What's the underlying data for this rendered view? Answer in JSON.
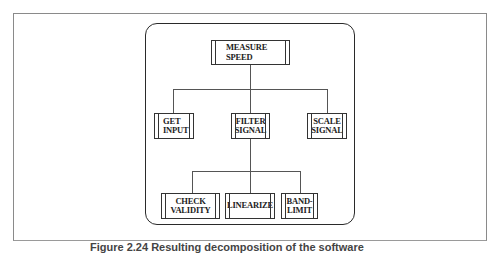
{
  "diagram": {
    "type": "structure-chart",
    "root": {
      "label": "MEASURE\nSPEED"
    },
    "level1": [
      {
        "label": "GET\nINPUT"
      },
      {
        "label": "FILTER\nSIGNAL"
      },
      {
        "label": "SCALE\nSIGNAL"
      }
    ],
    "level2": [
      {
        "label": "CHECK\nVALIDITY",
        "parent": "FILTER SIGNAL"
      },
      {
        "label": "LINEARIZE",
        "parent": "FILTER SIGNAL"
      },
      {
        "label": "BAND-\nLIMIT",
        "parent": "FILTER SIGNAL"
      }
    ],
    "edges": [
      [
        "MEASURE SPEED",
        "GET INPUT"
      ],
      [
        "MEASURE SPEED",
        "FILTER SIGNAL"
      ],
      [
        "MEASURE SPEED",
        "SCALE SIGNAL"
      ],
      [
        "FILTER SIGNAL",
        "CHECK VALIDITY"
      ],
      [
        "FILTER SIGNAL",
        "LINEARIZE"
      ],
      [
        "FILTER SIGNAL",
        "BAND-LIMIT"
      ]
    ]
  },
  "caption": "Figure 2.24  Resulting decomposition of the software"
}
